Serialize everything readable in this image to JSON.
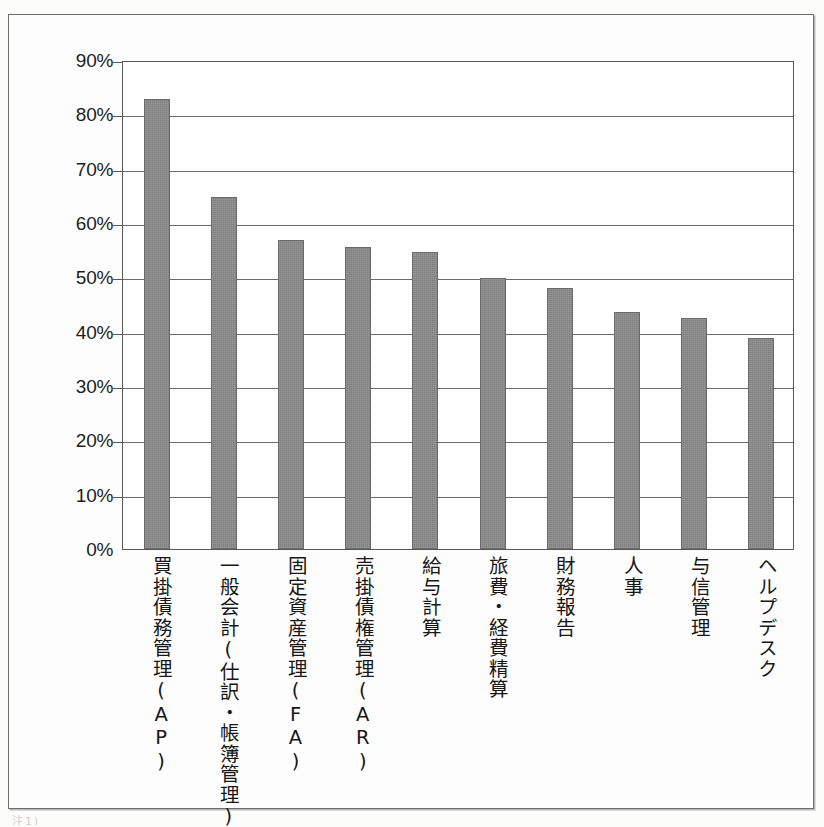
{
  "figure": {
    "frame_border_color": "#6d6d6d",
    "background_color": "#fdfdfd",
    "bottom_caption_fragment": "注1)"
  },
  "chart_data": {
    "type": "bar",
    "title": "",
    "subtitle": "",
    "xlabel": "",
    "ylabel": "",
    "ylim": [
      0,
      90
    ],
    "ytick_labels": [
      "90%",
      "80%",
      "70%",
      "60%",
      "50%",
      "40%",
      "30%",
      "20%",
      "10%",
      "0%"
    ],
    "ytick_values": [
      90,
      80,
      70,
      60,
      50,
      40,
      30,
      20,
      10,
      0
    ],
    "ytick_step": 10,
    "grid": true,
    "grid_axis": "y",
    "legend": false,
    "legend_position": "none",
    "orientation": "vertical",
    "bar_color": "#7e7e7e",
    "bar_edge_color": "#6a6a6a",
    "value_labels_shown": false,
    "categories": [
      "買掛債務管理(AP)",
      "一般会計(仕訳・帳簿管理)",
      "固定資産管理(FA)",
      "売掛債権管理(AR)",
      "給与計算",
      "旅費・経費精算",
      "財務報告",
      "人事",
      "与信管理",
      "ヘルプデスク"
    ],
    "values": [
      82.8,
      64.8,
      56.9,
      55.6,
      54.6,
      49.8,
      48.1,
      43.7,
      42.6,
      38.8
    ],
    "value_unit": "%"
  }
}
